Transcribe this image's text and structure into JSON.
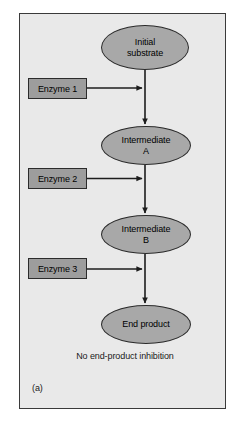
{
  "figure": {
    "panel_label": "(a)",
    "caption": "No end-product inhibition",
    "background_color": "#e9e9e9",
    "border_color": "#3a3a3a"
  },
  "diagram": {
    "type": "flowchart",
    "title": "No end-product inhibition",
    "node_fill_color": "#a8a8a8",
    "enzyme_fill_color": "#9d9d9d",
    "arrow_color": "#1c1c1c",
    "nodes": [
      {
        "id": "initial-substrate",
        "shape": "ellipse",
        "line1": "Initial",
        "line2": "substrate"
      },
      {
        "id": "intermediate-a",
        "shape": "ellipse",
        "line1": "Intermediate",
        "line2": "A"
      },
      {
        "id": "intermediate-b",
        "shape": "ellipse",
        "line1": "Intermediate",
        "line2": "B"
      },
      {
        "id": "end-product",
        "shape": "ellipse",
        "line1": "End product",
        "line2": ""
      }
    ],
    "enzymes": [
      {
        "id": "enzyme-1",
        "shape": "rectangle",
        "label": "Enzyme 1"
      },
      {
        "id": "enzyme-2",
        "shape": "rectangle",
        "label": "Enzyme 2"
      },
      {
        "id": "enzyme-3",
        "shape": "rectangle",
        "label": "Enzyme 3"
      }
    ],
    "edges": [
      {
        "from": "initial-substrate",
        "to": "intermediate-a",
        "direction": "down",
        "style": "solid-arrow"
      },
      {
        "from": "intermediate-a",
        "to": "intermediate-b",
        "direction": "down",
        "style": "solid-arrow"
      },
      {
        "from": "intermediate-b",
        "to": "end-product",
        "direction": "down",
        "style": "solid-arrow"
      },
      {
        "from": "enzyme-1",
        "to": "initial-substrate-to-intermediate-a",
        "direction": "right",
        "style": "solid-arrow"
      },
      {
        "from": "enzyme-2",
        "to": "intermediate-a-to-intermediate-b",
        "direction": "right",
        "style": "solid-arrow"
      },
      {
        "from": "enzyme-3",
        "to": "intermediate-b-to-end-product",
        "direction": "right",
        "style": "solid-arrow"
      }
    ]
  }
}
